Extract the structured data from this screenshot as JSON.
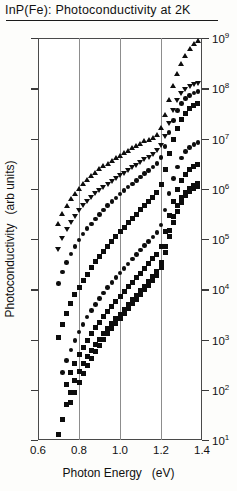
{
  "title": "InP(Fe): Photoconductivity at 2K",
  "axis": {
    "x_title": "Photon Energy",
    "x_unit": "(eV)",
    "y_title": "Photoconductivity",
    "y_unit": "(arb units)"
  },
  "chart_data": {
    "type": "scatter",
    "title": "InP(Fe): Photoconductivity at 2K",
    "xlabel": "Photon Energy (eV)",
    "ylabel": "Photoconductivity (arb units)",
    "xlim": [
      0.6,
      1.4
    ],
    "ylim": [
      10.0,
      1000000000.0
    ],
    "yscale": "log",
    "xticks": [
      "0.6",
      "0.8",
      "1.0",
      "1.2",
      "1.4"
    ],
    "xtick_values": [
      0.6,
      0.8,
      1.0,
      1.2,
      1.4
    ],
    "yticks": [
      "10",
      "10",
      "10",
      "10",
      "10",
      "10",
      "10",
      "10",
      "10"
    ],
    "ytick_exponents": [
      "1",
      "2",
      "3",
      "4",
      "5",
      "6",
      "7",
      "8",
      "9"
    ],
    "ytick_values": [
      10.0,
      100.0,
      1000.0,
      10000.0,
      100000.0,
      1000000.0,
      10000000.0,
      100000000.0,
      1000000000.0
    ],
    "grid": "vertical-only",
    "gridline_x": [
      0.8,
      1.0,
      1.2
    ],
    "legend": "none",
    "series": [
      {
        "name": "curve-1",
        "marker": "triangle-up",
        "x": [
          0.7,
          0.72,
          0.74,
          0.76,
          0.78,
          0.8,
          0.82,
          0.84,
          0.86,
          0.88,
          0.9,
          0.92,
          0.94,
          0.96,
          0.98,
          1.0,
          1.02,
          1.04,
          1.06,
          1.08,
          1.1,
          1.12,
          1.14,
          1.16,
          1.18,
          1.2,
          1.22,
          1.24,
          1.26,
          1.28,
          1.3,
          1.32,
          1.34,
          1.36,
          1.38
        ],
        "y": [
          200000.0,
          320000.0,
          460000.0,
          620000.0,
          800000.0,
          1000000.0,
          1250000.0,
          1500000.0,
          1800000.0,
          2100000.0,
          2450000.0,
          2800000.0,
          3200000.0,
          3600000.0,
          4100000.0,
          4600000.0,
          5200000.0,
          5800000.0,
          6500000.0,
          7200000.0,
          8000000.0,
          8800000.0,
          9600000.0,
          10500000.0,
          12000000.0,
          16000000.0,
          30000000.0,
          60000000.0,
          110000000.0,
          190000000.0,
          300000000.0,
          440000000.0,
          600000000.0,
          760000000.0,
          900000000.0
        ]
      },
      {
        "name": "curve-2",
        "marker": "triangle-down",
        "x": [
          0.7,
          0.72,
          0.74,
          0.76,
          0.78,
          0.8,
          0.82,
          0.84,
          0.86,
          0.88,
          0.9,
          0.92,
          0.94,
          0.96,
          0.98,
          1.0,
          1.02,
          1.04,
          1.06,
          1.08,
          1.1,
          1.12,
          1.14,
          1.16,
          1.18,
          1.2,
          1.22,
          1.24,
          1.26,
          1.28,
          1.3,
          1.32,
          1.34,
          1.36,
          1.38
        ],
        "y": [
          60000.0,
          100000.0,
          150000.0,
          210000.0,
          280000.0,
          360000.0,
          450000.0,
          550000.0,
          660000.0,
          780000.0,
          900000.0,
          1050000.0,
          1200000.0,
          1400000.0,
          1600000.0,
          1800000.0,
          2000000.0,
          2300000.0,
          2600000.0,
          2900000.0,
          3300000.0,
          3700000.0,
          4200000.0,
          4800000.0,
          5600000.0,
          7000000.0,
          11000000.0,
          20000000.0,
          36000000.0,
          56000000.0,
          76000000.0,
          92000000.0,
          105000000.0,
          115000000.0,
          122000000.0
        ]
      },
      {
        "name": "curve-3",
        "marker": "circle",
        "x": [
          0.7,
          0.72,
          0.74,
          0.76,
          0.78,
          0.8,
          0.82,
          0.84,
          0.86,
          0.88,
          0.9,
          0.92,
          0.94,
          0.96,
          0.98,
          1.0,
          1.02,
          1.04,
          1.06,
          1.08,
          1.1,
          1.12,
          1.14,
          1.16,
          1.18,
          1.2,
          1.22,
          1.24,
          1.26,
          1.28,
          1.3,
          1.32,
          1.34,
          1.36,
          1.38
        ],
        "y": [
          13000.0,
          22000.0,
          34000.0,
          50000.0,
          70000.0,
          95000.0,
          125000.0,
          160000.0,
          200000.0,
          250000.0,
          310000.0,
          380000.0,
          460000.0,
          550000.0,
          660000.0,
          780000.0,
          920000.0,
          1080000.0,
          1250000.0,
          1450000.0,
          1700000.0,
          2000000.0,
          2300000.0,
          2700000.0,
          3200000.0,
          4200000.0,
          7000000.0,
          13000000.0,
          23000000.0,
          36000000.0,
          50000000.0,
          62000000.0,
          72000000.0,
          80000000.0,
          86000000.0
        ]
      },
      {
        "name": "curve-4",
        "marker": "square",
        "x": [
          0.7,
          0.72,
          0.74,
          0.76,
          0.78,
          0.8,
          0.82,
          0.84,
          0.86,
          0.88,
          0.9,
          0.92,
          0.94,
          0.96,
          0.98,
          1.0,
          1.02,
          1.04,
          1.06,
          1.08,
          1.1,
          1.12,
          1.14,
          1.16,
          1.18,
          1.2,
          1.22,
          1.24,
          1.26,
          1.28,
          1.3,
          1.32,
          1.34,
          1.36,
          1.38
        ],
        "y": [
          1100.0,
          2000.0,
          3300.0,
          5200.0,
          7800.0,
          11000.0,
          15000.0,
          20000.0,
          27000.0,
          35000.0,
          45000.0,
          57000.0,
          72000.0,
          90000.0,
          112000.0,
          138000.0,
          170000.0,
          210000.0,
          255000.0,
          310000.0,
          380000.0,
          460000.0,
          560000.0,
          680000.0,
          840000.0,
          1200000.0,
          2400000.0,
          5000000.0,
          9500000.0,
          16000000.0,
          24000000.0,
          32000000.0,
          39000000.0,
          45000000.0,
          50000000.0
        ]
      },
      {
        "name": "curve-5",
        "marker": "circle",
        "x": [
          0.72,
          0.74,
          0.76,
          0.78,
          0.8,
          0.82,
          0.84,
          0.86,
          0.88,
          0.9,
          0.92,
          0.94,
          0.96,
          0.98,
          1.0,
          1.02,
          1.04,
          1.06,
          1.08,
          1.1,
          1.12,
          1.14,
          1.16,
          1.18,
          1.2,
          1.22,
          1.24,
          1.26,
          1.28,
          1.3,
          1.32,
          1.34,
          1.36,
          1.38
        ],
        "y": [
          220.0,
          380.0,
          620.0,
          950.0,
          1400.0,
          2000.0,
          2800.0,
          3800.0,
          5000.0,
          6500.0,
          8400.0,
          10700.0,
          13500.0,
          17000.0,
          21000.0,
          26000.0,
          32000.0,
          40000.0,
          49000.0,
          60000.0,
          74000.0,
          90000.0,
          110000.0,
          135000.0,
          190000.0,
          380000.0,
          800000.0,
          1600000.0,
          2700000.0,
          4100000.0,
          5500000.0,
          6600000.0,
          7600000.0,
          8400000.0
        ]
      },
      {
        "name": "curve-6",
        "marker": "square",
        "x": [
          0.74,
          0.76,
          0.78,
          0.8,
          0.82,
          0.84,
          0.86,
          0.88,
          0.9,
          0.92,
          0.94,
          0.96,
          0.98,
          1.0,
          1.02,
          1.04,
          1.06,
          1.08,
          1.1,
          1.12,
          1.14,
          1.16,
          1.18,
          1.2,
          1.22,
          1.24,
          1.26,
          1.28,
          1.3,
          1.32,
          1.34,
          1.36,
          1.38
        ],
        "y": [
          130.0,
          220.0,
          340.0,
          500.0,
          700.0,
          960.0,
          1300.0,
          1700.0,
          2200.0,
          2850.0,
          3600.0,
          4600.0,
          5800.0,
          7200.0,
          9000.0,
          11200.0,
          13800.0,
          17000.0,
          21000.0,
          26000.0,
          32000.0,
          40000.0,
          50000.0,
          70000.0,
          140000.0,
          290000.0,
          560000.0,
          950000.0,
          1450000.0,
          1950000.0,
          2400000.0,
          2800000.0,
          3100000.0
        ]
      },
      {
        "name": "curve-7",
        "marker": "square",
        "x": [
          0.76,
          0.78,
          0.8,
          0.82,
          0.84,
          0.86,
          0.88,
          0.9,
          0.92,
          0.94,
          0.96,
          0.98,
          1.0,
          1.02,
          1.04,
          1.06,
          1.08,
          1.1,
          1.12,
          1.14,
          1.16,
          1.18,
          1.2,
          1.22,
          1.24,
          1.26,
          1.28,
          1.3,
          1.32,
          1.34,
          1.36,
          1.38
        ],
        "y": [
          55.0,
          90.0,
          140.0,
          210.0,
          300.0,
          420.0,
          570.0,
          760.0,
          1000.0,
          1300.0,
          1650.0,
          2100.0,
          2650.0,
          3300.0,
          4100.0,
          5100.0,
          6300.0,
          7800.0,
          9700.0,
          12000.0,
          15000.0,
          19000.0,
          27000.0,
          54000.0,
          110000.0,
          210000.0,
          360000.0,
          540000.0,
          720000.0,
          880000.0,
          1000000.0,
          1100000.0
        ]
      },
      {
        "name": "curve-8",
        "marker": "square",
        "x": [
          0.7,
          0.72,
          0.74,
          0.76,
          0.78,
          0.8,
          0.82,
          0.84,
          0.86,
          0.88,
          0.9,
          0.92,
          0.94,
          0.96,
          0.98,
          1.0,
          1.02,
          1.04,
          1.06,
          1.08,
          1.1,
          1.12,
          1.14,
          1.16,
          1.18,
          1.2,
          1.22,
          1.24,
          1.26,
          1.28,
          1.3,
          1.32,
          1.34,
          1.36,
          1.38
        ],
        "y": [
          13.0,
          26.0,
          50.0,
          90.0,
          150.0,
          230.0,
          330.0,
          450.0,
          600.0,
          780.0,
          1000.0,
          1300.0,
          1650.0,
          2100.0,
          2600.0,
          3200.0,
          4000.0,
          5000.0,
          6200.0,
          7600.0,
          9400.0,
          11600.0,
          14500.0,
          18000.0,
          23000.0,
          34000.0,
          70000.0,
          150000.0,
          280000.0,
          460000.0,
          660000.0,
          840000.0,
          1000000.0,
          1150000.0,
          1250000.0
        ]
      }
    ]
  }
}
